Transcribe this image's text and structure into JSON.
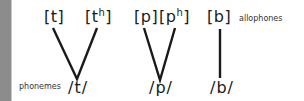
{
  "diagram": {
    "labels": {
      "allophones": "allophones",
      "phonemes": "phonemes"
    },
    "groups": [
      {
        "phoneme": "/t/",
        "allophones": [
          {
            "base": "[t",
            "sup": "",
            "close": "]"
          },
          {
            "base": "[t",
            "sup": "h",
            "close": "]"
          }
        ]
      },
      {
        "phoneme": "/p/",
        "allophones": [
          {
            "base": "[p",
            "sup": "",
            "close": "]"
          },
          {
            "base": "[p",
            "sup": "h",
            "close": "]"
          }
        ]
      },
      {
        "phoneme": "/b/",
        "allophones": [
          {
            "base": "[b",
            "sup": "",
            "close": "]"
          }
        ]
      }
    ],
    "colors": {
      "line": "#1a1a1a",
      "left_strip": "#8c8c8c",
      "background": "#ffffff"
    }
  }
}
